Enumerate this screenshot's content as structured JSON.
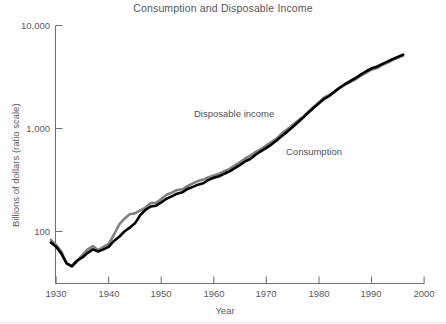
{
  "chart": {
    "title": "Consumption and Disposable Income",
    "y_axis_title": "Billions of dollars (ratio scale)",
    "x_axis_title": "Year",
    "y_ticks": [
      "10,000",
      "1,000",
      "100"
    ],
    "x_ticks": [
      "1930",
      "1940",
      "1950",
      "1960",
      "1970",
      "1980",
      "1990",
      "2000"
    ],
    "label_disposable_income": "Disposable income",
    "label_consumption": "Consumption",
    "color_disposable_income": "#808080",
    "color_consumption": "#000000"
  },
  "chart_data": {
    "type": "line",
    "title": "Consumption and Disposable Income",
    "xlabel": "Year",
    "ylabel": "Billions of dollars (ratio scale)",
    "yscale": "log",
    "ylim": [
      40,
      10000
    ],
    "xlim": [
      1929,
      2000
    ],
    "grid": false,
    "legend": "inline-annotations",
    "x": [
      1929,
      1930,
      1931,
      1932,
      1933,
      1934,
      1935,
      1936,
      1937,
      1938,
      1939,
      1940,
      1941,
      1942,
      1943,
      1944,
      1945,
      1946,
      1947,
      1948,
      1949,
      1950,
      1951,
      1952,
      1953,
      1954,
      1955,
      1956,
      1957,
      1958,
      1959,
      1960,
      1961,
      1962,
      1963,
      1964,
      1965,
      1966,
      1967,
      1968,
      1969,
      1970,
      1971,
      1972,
      1973,
      1974,
      1975,
      1976,
      1977,
      1978,
      1979,
      1980,
      1981,
      1982,
      1983,
      1984,
      1985,
      1986,
      1987,
      1988,
      1989,
      1990,
      1991,
      1992,
      1993,
      1994,
      1995,
      1996
    ],
    "series": [
      {
        "name": "Disposable income",
        "color": "#808080",
        "values": [
          83,
          74,
          64,
          49,
          46,
          52,
          59,
          67,
          72,
          66,
          71,
          76,
          93,
          117,
          133,
          147,
          150,
          160,
          170,
          189,
          189,
          207,
          227,
          238,
          253,
          257,
          275,
          293,
          309,
          319,
          337,
          350,
          364,
          385,
          405,
          438,
          473,
          512,
          547,
          592,
          631,
          685,
          742,
          801,
          901,
          984,
          1084,
          1186,
          1302,
          1454,
          1619,
          1795,
          2004,
          2123,
          2268,
          2510,
          2670,
          2842,
          3019,
          3258,
          3481,
          3725,
          3866,
          4130,
          4332,
          4610,
          4855,
          5104
        ]
      },
      {
        "name": "Consumption",
        "color": "#000000",
        "values": [
          78,
          71,
          61,
          49,
          46,
          52,
          56,
          62,
          67,
          64,
          67,
          71,
          81,
          89,
          100,
          109,
          120,
          144,
          162,
          175,
          178,
          192,
          208,
          219,
          233,
          240,
          259,
          271,
          285,
          294,
          317,
          332,
          343,
          364,
          384,
          412,
          444,
          481,
          509,
          559,
          604,
          648,
          702,
          770,
          852,
          933,
          1034,
          1151,
          1278,
          1428,
          1592,
          1757,
          1941,
          2077,
          2291,
          2492,
          2705,
          2892,
          3094,
          3349,
          3595,
          3839,
          3975,
          4219,
          4454,
          4717,
          4958,
          5208
        ]
      }
    ],
    "annotations": [
      {
        "text": "Disposable income",
        "x": 1962,
        "y": 1300
      },
      {
        "text": "Consumption",
        "x": 1974,
        "y": 560
      }
    ]
  }
}
